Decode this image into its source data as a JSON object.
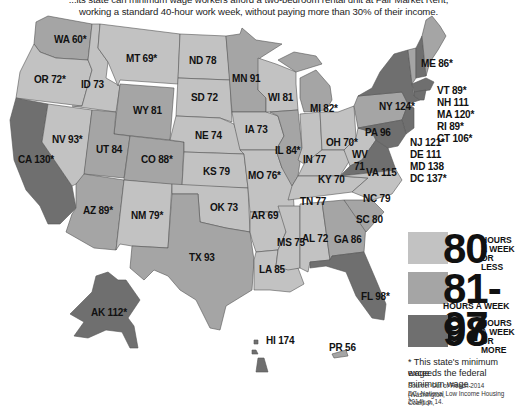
{
  "header": {
    "subtitle_line1": "...its state can minimum wage workers afford a two-bedroom rental unit at Fair Market Rent,",
    "subtitle_line2": "working a standard 40-hour work week, without paying more than 30% of their income."
  },
  "colors": {
    "low": "#c2c2c2",
    "mid": "#a5a5a5",
    "high": "#6f6f6f"
  },
  "states": {
    "WA": "WA 60*",
    "OR": "OR 72*",
    "CA": "CA 130*",
    "ID": "ID 73",
    "NV": "NV 93*",
    "MT": "MT 69*",
    "WY": "WY 81",
    "UT": "UT 84",
    "AZ": "AZ 89*",
    "CO": "CO 88*",
    "NM": "NM 79*",
    "ND": "ND 78",
    "SD": "SD 72",
    "NE": "NE 74",
    "KS": "KS 79",
    "OK": "OK 73",
    "TX": "TX 93",
    "MN": "MN 91",
    "IA": "IA 73",
    "MO": "MO 76*",
    "AR": "AR 69",
    "LA": "LA 85",
    "WI": "WI 81",
    "IL": "IL 84*",
    "MI": "MI 82*",
    "IN": "IN 77",
    "OH": "OH 70*",
    "KY": "KY 70",
    "TN": "TN 77",
    "MS": "MS 75",
    "AL": "AL 72",
    "GA": "GA 86",
    "FL": "FL 98*",
    "SC": "SC 80",
    "NC": "NC 79",
    "VA": "VA 115",
    "WV": "WV",
    "WV_val": "71",
    "PA": "PA 96",
    "NY": "NY 124*",
    "ME": "ME 86*",
    "VT": "VT 89*",
    "NH": "NH 111",
    "MA": "MA 120*",
    "RI": "RI 89*",
    "CT": "CT 106*",
    "NJ": "NJ 121*",
    "DE": "DE 111",
    "MD": "MD 138",
    "DC": "DC 137*",
    "AK": "AK 112*",
    "HI": "HI 174",
    "PR": "PR 56"
  },
  "legend": {
    "low": {
      "num": "80",
      "l1": "HOURS",
      "l2": "A WEEK",
      "l3": "OR LESS"
    },
    "mid": {
      "num": "81-97",
      "l1": "HOURS A WEEK"
    },
    "high": {
      "num": "98",
      "l1": "HOURS",
      "l2": "A WEEK",
      "l3": "OR MORE"
    }
  },
  "footnote": {
    "line1": "* This state's minimum wage",
    "line2": "exceeds the federal minimum wage.",
    "source_label": "Source:",
    "source_line1": " Out of Reach 2014 (Washington,",
    "source_line2": "DC: National Low Income Housing Coalition,",
    "source_line3": "2014), p. 14."
  }
}
